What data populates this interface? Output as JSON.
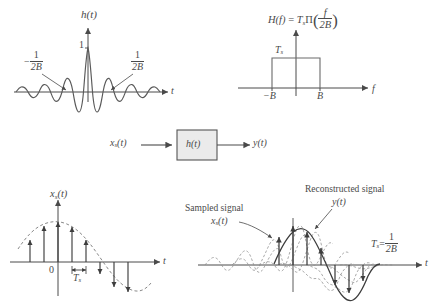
{
  "figure": {
    "ink_color": "#4a4a4a",
    "dash_color": "#777777",
    "background": "#ffffff"
  },
  "panel_impulse_response": {
    "name": "Impulse response h(t) sinc plot",
    "y_axis_label": "h(t)",
    "x_axis_label": "t",
    "peak_label": "1",
    "left_zero_label_num": "1",
    "left_zero_label_den": "2B",
    "left_zero_label_sign": "−",
    "right_zero_label_num": "1",
    "right_zero_label_den": "2B",
    "function": "h(t) = sinc(2Bt)",
    "zero_crossings": [
      "-1/2B",
      "1/2B"
    ]
  },
  "panel_transfer_function": {
    "name": "Transfer function H(f) rectangle plot",
    "title_Hf": "H(f)",
    "title_equals": "=",
    "title_Ts": "T",
    "title_Ts_sub": "s",
    "title_pi": "Π",
    "title_arg_num": "f",
    "title_arg_den": "2B",
    "height_label": "T",
    "height_label_sub": "s",
    "x_axis_label": "f",
    "tick_left": "−B",
    "tick_right": "B",
    "rect_height_value": "Ts",
    "rect_band": [
      "-B",
      "B"
    ]
  },
  "panel_block_diagram": {
    "name": "Filtering block diagram",
    "input_label": "x",
    "input_label_sub": "s",
    "input_label_tail": "(t)",
    "block_label": "h(t)",
    "output_label": "y(t)",
    "block_fill": "#ebebeb",
    "block_stroke": "#555555"
  },
  "panel_sampled_signal": {
    "name": "Sampled signal impulse train plot",
    "y_axis_label_main": "x",
    "y_axis_label_sub": "s",
    "y_axis_label_tail": "(t)",
    "x_axis_label": "t",
    "origin_label": "0",
    "period_label_main": "T",
    "period_label_sub": "s",
    "envelope": "sinusoid (dashed)",
    "sample_count": 11
  },
  "panel_reconstruction": {
    "name": "Reconstruction from samples plot",
    "annotation_sampled_line1": "Sampled signal",
    "annotation_sampled_line2_main": "x",
    "annotation_sampled_line2_sub": "s",
    "annotation_sampled_line2_tail": "(t)",
    "annotation_reconstructed_line1": "Reconstructed signal",
    "annotation_reconstructed_line2": "y(t)",
    "x_axis_label": "t",
    "relation_Ts": "T",
    "relation_Ts_sub": "s",
    "relation_equals": "=",
    "relation_num": "1",
    "relation_den": "2B"
  }
}
